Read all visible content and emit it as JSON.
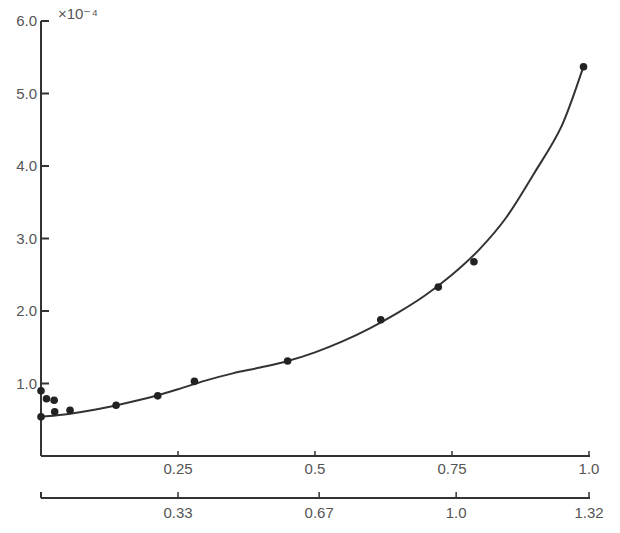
{
  "chart_data": {
    "type": "scatter",
    "title": "",
    "ylabel": "",
    "y_multiplier_label": "×10⁻⁴",
    "xlabel": "",
    "ylim": [
      0,
      6.0
    ],
    "xlim": [
      0,
      1.0
    ],
    "grid": false,
    "legend": null,
    "y_ticks": [
      {
        "value": 1.0,
        "label": "1.0"
      },
      {
        "value": 2.0,
        "label": "2.0"
      },
      {
        "value": 3.0,
        "label": "3.0"
      },
      {
        "value": 4.0,
        "label": "4.0"
      },
      {
        "value": 5.0,
        "label": "5.0"
      },
      {
        "value": 6.0,
        "label": "6.0"
      }
    ],
    "x_axis_primary": {
      "ticks": [
        {
          "value": 0.25,
          "label": "0.25"
        },
        {
          "value": 0.5,
          "label": "0.5"
        },
        {
          "value": 0.75,
          "label": "0.75"
        },
        {
          "value": 1.0,
          "label": "1.0"
        }
      ]
    },
    "x_axis_secondary": {
      "range": [
        0,
        1.32
      ],
      "ticks": [
        {
          "value": 0.33,
          "label": "0.33"
        },
        {
          "value": 0.67,
          "label": "0.67"
        },
        {
          "value": 1.0,
          "label": "1.0"
        },
        {
          "value": 1.32,
          "label": "1.32"
        }
      ]
    },
    "series": [
      {
        "name": "measured points",
        "kind": "scatter",
        "x": [
          0.0,
          0.0,
          0.01,
          0.024,
          0.025,
          0.053,
          0.137,
          0.213,
          0.28,
          0.45,
          0.62,
          0.725,
          0.79,
          0.99
        ],
        "y": [
          0.54,
          0.9,
          0.79,
          0.77,
          0.61,
          0.63,
          0.7,
          0.83,
          1.03,
          1.31,
          1.88,
          2.33,
          2.68,
          5.37
        ]
      },
      {
        "name": "fitted curve",
        "kind": "line",
        "x": [
          0.0,
          0.05,
          0.1,
          0.15,
          0.2,
          0.25,
          0.3,
          0.35,
          0.4,
          0.45,
          0.5,
          0.55,
          0.6,
          0.65,
          0.7,
          0.75,
          0.8,
          0.85,
          0.9,
          0.95,
          0.99
        ],
        "y": [
          0.54,
          0.58,
          0.64,
          0.72,
          0.81,
          0.92,
          1.04,
          1.14,
          1.22,
          1.31,
          1.43,
          1.58,
          1.76,
          1.97,
          2.21,
          2.5,
          2.85,
          3.3,
          3.9,
          4.55,
          5.37
        ]
      }
    ]
  }
}
